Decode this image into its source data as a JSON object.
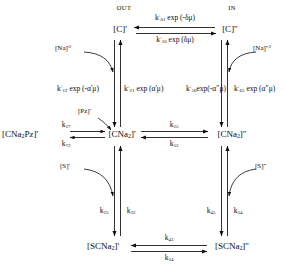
{
  "diagram": {
    "type": "kinetic-scheme",
    "headers": {
      "out": "OUT",
      "in": "IN"
    },
    "species": {
      "c_out": "[C]'",
      "c_in": "[C]\"",
      "cna2_out": "[CNa2]'",
      "cna2_in": "[CNa2]\"",
      "cna2pz_out": "[CNa2Pz]'",
      "scna2_out": "[SCNa2]'",
      "scna2_in": "[SCNa2]\""
    },
    "reactants": {
      "na_out": "[Na]'2",
      "na_in": "[Na]\"2",
      "pz_out": "[Pz]'",
      "s_out": "[S]'",
      "s_in": "[S]\""
    },
    "rates": {
      "top_back": "k°61 exp (-δμ)",
      "top_fwd": "k°16 exp (δμ)",
      "left_down": "k°12 exp (-α'μ)",
      "left_up": "k°21 exp (α'μ)",
      "right_down": "k°56 exp(-α\"μ)",
      "right_up": "k°65 exp (α\"μ)",
      "mid_fwd": "k25",
      "mid_back": "k52",
      "pz_fwd": "k27",
      "pz_back": "k72",
      "left_lower_down": "k23",
      "left_lower_up": "k32",
      "right_lower_down": "k45",
      "right_lower_up": "k54",
      "bottom_back": "k43",
      "bottom_fwd": "k34"
    }
  },
  "colors": {
    "ink": "#0d0d0d",
    "background": "#ffffff"
  }
}
